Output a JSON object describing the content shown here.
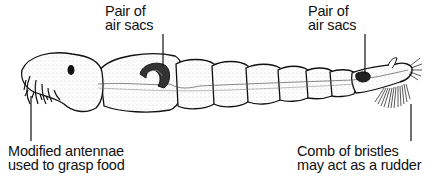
{
  "diagram": {
    "labels": [
      {
        "id": "air-sacs-front",
        "lines": [
          "Pair of",
          "air sacs"
        ]
      },
      {
        "id": "air-sacs-rear",
        "lines": [
          "Pair of",
          "air sacs"
        ]
      },
      {
        "id": "antennae",
        "lines": [
          "Modified antennae",
          "used to grasp food"
        ]
      },
      {
        "id": "bristles",
        "lines": [
          "Comb of bristles",
          "may act as a rudder"
        ]
      }
    ],
    "colors": {
      "ink": "#111111",
      "background": "#ffffff",
      "shade": "#d8d8d8"
    }
  }
}
